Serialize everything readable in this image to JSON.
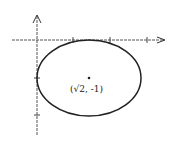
{
  "diagram": {
    "type": "ellipse-on-axes",
    "center_label": "(√2, -1)",
    "center": {
      "x": "√2",
      "y": -1
    },
    "colors": {
      "stroke": "#222222",
      "axis": "#444444",
      "background": "#ffffff"
    },
    "elements": [
      "x-axis",
      "y-axis",
      "ellipse",
      "center-point"
    ]
  }
}
